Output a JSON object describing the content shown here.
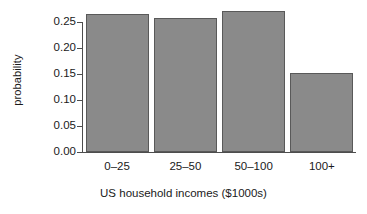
{
  "chart_data": {
    "type": "bar",
    "title": "",
    "subtitle": "",
    "xlabel": "US household incomes ($1000s)",
    "ylabel": "probability",
    "categories": [
      "0–25",
      "25–50",
      "50–100",
      "100+"
    ],
    "values": [
      0.265,
      0.258,
      0.271,
      0.152
    ],
    "ylim": [
      0.0,
      0.275
    ],
    "xlim": [
      0,
      4
    ],
    "yticks": [
      0.0,
      0.05,
      0.1,
      0.15,
      0.2,
      0.25
    ],
    "ytick_labels": [
      "0.00",
      "0.05",
      "0.10",
      "0.15",
      "0.20",
      "0.25"
    ],
    "xtick_labels": [
      "0–25",
      "25–50",
      "50–100",
      "100+"
    ],
    "grid": false,
    "legend": null,
    "legend_position": "none",
    "annotations": [],
    "bar_fill_color": "#8a8a8a",
    "bar_edge_color": "#595959",
    "axis_color": "#4d4d4d",
    "background_color": "#ffffff",
    "text_color": "#1a1a1a"
  },
  "axes": {
    "y_title": "probability",
    "x_title": "US household incomes ($1000s)"
  }
}
